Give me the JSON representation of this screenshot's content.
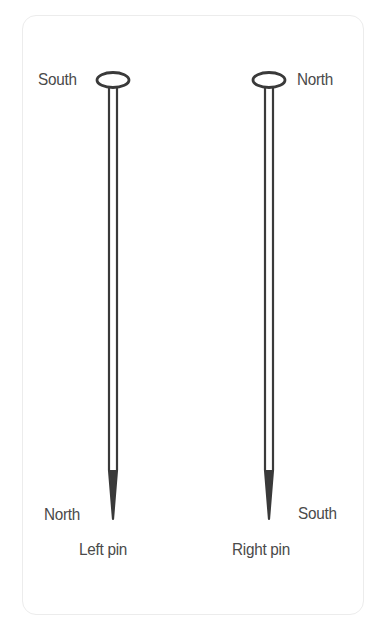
{
  "diagram": {
    "pins": [
      {
        "name": "Left pin",
        "caption": "Left pin",
        "head_label": "South",
        "tip_label": "North"
      },
      {
        "name": "Right pin",
        "caption": "Right pin",
        "head_label": "North",
        "tip_label": "South"
      }
    ],
    "colors": {
      "pin_stroke": "#3a3a3a",
      "text": "#4a4a4a",
      "panel_border": "#ececec",
      "background": "#ffffff"
    }
  }
}
